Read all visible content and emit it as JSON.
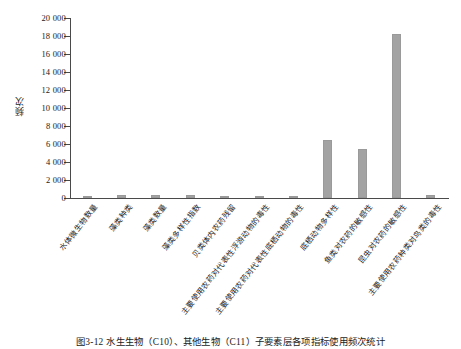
{
  "chart_data": {
    "type": "bar",
    "title": "",
    "xlabel": "",
    "ylabel": "频次",
    "ylim": [
      0,
      20000
    ],
    "ytick_step": 2000,
    "yticks": [
      "0",
      "2 000",
      "4 000",
      "6 000",
      "8 000",
      "10 000",
      "12 000",
      "14 000",
      "16 000",
      "18 000",
      "20 000"
    ],
    "grid": false,
    "legend": "none",
    "bar_color": "#a3a3a3",
    "categories": [
      "水体微生物数量",
      "藻类种类",
      "藻类数量",
      "藻类多样性指数",
      "贝类体内农药残留",
      "主要使用农药对代表性浮游动物的毒性",
      "主要使用农药对代表性底栖动物的毒性",
      "底栖动物多样性",
      "鱼类对农药的敏感性",
      "昆虫对农药的敏感性",
      "主要使用农药种类对鸟类的毒性"
    ],
    "values": [
      150,
      330,
      340,
      360,
      180,
      200,
      120,
      6500,
      5500,
      18200,
      330
    ]
  },
  "caption": {
    "text": "图3-12  水生生物（C10）、其他生物（C11）子要素层各项指标使用频次统计"
  }
}
